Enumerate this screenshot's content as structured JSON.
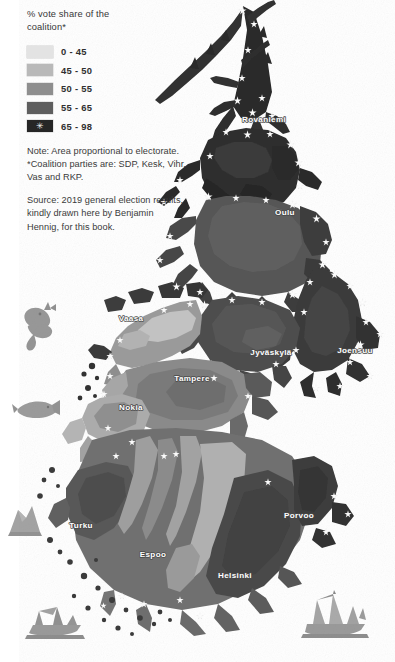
{
  "figure": {
    "kind": "cartogram-map",
    "region": "Finland",
    "background_color": "#ffffff"
  },
  "legend": {
    "title": "% vote share of the\ncoalition*",
    "marker_glyph": "✳",
    "classes": [
      {
        "label": "0 - 45",
        "color": "#e3e3e3",
        "min": 0,
        "max": 45,
        "has_marker": false
      },
      {
        "label": "45 - 50",
        "color": "#b9b9b9",
        "min": 45,
        "max": 50,
        "has_marker": false
      },
      {
        "label": "50 - 55",
        "color": "#8e8e8e",
        "min": 50,
        "max": 55,
        "has_marker": false
      },
      {
        "label": "55 - 65",
        "color": "#5e5e5e",
        "min": 55,
        "max": 65,
        "has_marker": false
      },
      {
        "label": "65 - 98",
        "color": "#262626",
        "min": 65,
        "max": 98,
        "has_marker": true
      }
    ]
  },
  "notes": {
    "note_text": "Note: Area proportional to electorate.\n*Coalition parties are: SDP, Kesk, Vihr,\nVas and RKP.",
    "source_text": "Source: 2019 general election results,\nkindly drawn here by Benjamin\nHennig, for this book."
  },
  "map": {
    "city_labels": [
      {
        "name": "Rovaniemi",
        "x": 264,
        "y": 122
      },
      {
        "name": "Oulu",
        "x": 285,
        "y": 215
      },
      {
        "name": "Vaasa",
        "x": 131,
        "y": 321
      },
      {
        "name": "Jyväskylä",
        "x": 271,
        "y": 355
      },
      {
        "name": "Joensuu",
        "x": 355,
        "y": 353
      },
      {
        "name": "Tampere",
        "x": 192,
        "y": 381
      },
      {
        "name": "Nokia",
        "x": 131,
        "y": 410
      },
      {
        "name": "Turku",
        "x": 81,
        "y": 528
      },
      {
        "name": "Porvoo",
        "x": 299,
        "y": 518
      },
      {
        "name": "Espoo",
        "x": 153,
        "y": 557
      },
      {
        "name": "Helsinki",
        "x": 235,
        "y": 578
      }
    ],
    "decorations": [
      {
        "name": "sea-monster-engraving",
        "x": 40,
        "y": 322
      },
      {
        "name": "fish-engraving",
        "x": 36,
        "y": 409
      },
      {
        "name": "iceberg-engraving",
        "x": 22,
        "y": 520
      },
      {
        "name": "shipwreck-engraving",
        "x": 55,
        "y": 625
      },
      {
        "name": "sailing-ship-engraving",
        "x": 335,
        "y": 622
      }
    ],
    "marker_note": "white star markers mark the highest-share (65-98) districts"
  }
}
